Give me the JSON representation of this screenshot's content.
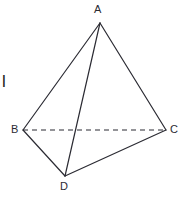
{
  "figure": {
    "canvas": {
      "width": 191,
      "height": 198,
      "background": "#ffffff"
    },
    "stroke_color": "#2b2b33",
    "stroke_width": 1.2,
    "dash_pattern": "5,4",
    "vertices": [
      {
        "id": "A",
        "label": "A",
        "x": 100,
        "y": 23
      },
      {
        "id": "B",
        "label": "B",
        "x": 23,
        "y": 130
      },
      {
        "id": "C",
        "label": "C",
        "x": 166,
        "y": 130
      },
      {
        "id": "D",
        "label": "D",
        "x": 65,
        "y": 176
      }
    ],
    "edges": [
      {
        "id": "AB",
        "from": "A",
        "to": "B",
        "style": "solid"
      },
      {
        "id": "AC",
        "from": "A",
        "to": "C",
        "style": "solid"
      },
      {
        "id": "AD",
        "from": "A",
        "to": "D",
        "style": "solid"
      },
      {
        "id": "BD",
        "from": "B",
        "to": "D",
        "style": "solid"
      },
      {
        "id": "DC",
        "from": "D",
        "to": "C",
        "style": "solid"
      },
      {
        "id": "BC",
        "from": "B",
        "to": "C",
        "style": "dashed"
      }
    ],
    "margin_mark": "l"
  }
}
